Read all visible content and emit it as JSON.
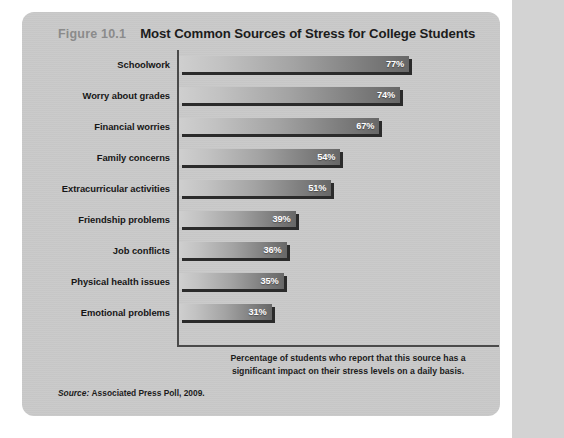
{
  "figure": {
    "number": "Figure 10.1",
    "title": "Most Common Sources of Stress for College Students",
    "caption_line1": "Percentage of students who report that this source has a",
    "caption_line2": "significant impact on their stress levels on a daily basis.",
    "source_label": "Source:",
    "source_text": "Associated Press Poll, 2009."
  },
  "chart_data": {
    "type": "bar",
    "orientation": "horizontal",
    "title": "Most Common Sources of Stress for College Students",
    "xlabel": "Percentage of students who report that this source has a significant impact on their stress levels on a daily basis.",
    "ylabel": "",
    "xlim": [
      0,
      100
    ],
    "grid": false,
    "legend": null,
    "value_suffix": "%",
    "categories": [
      "Schoolwork",
      "Worry about grades",
      "Financial worries",
      "Family concerns",
      "Extracurricular activities",
      "Friendship problems",
      "Job conflicts",
      "Physical health issues",
      "Emotional problems"
    ],
    "values": [
      77,
      74,
      67,
      54,
      51,
      39,
      36,
      35,
      31
    ],
    "value_labels": [
      "77%",
      "74%",
      "67%",
      "54%",
      "51%",
      "39%",
      "36%",
      "35%",
      "31%"
    ],
    "bars": [
      {
        "category": "Schoolwork",
        "value": 77,
        "label": "77%"
      },
      {
        "category": "Worry about grades",
        "value": 74,
        "label": "74%"
      },
      {
        "category": "Financial worries",
        "value": 67,
        "label": "67%"
      },
      {
        "category": "Family concerns",
        "value": 54,
        "label": "54%"
      },
      {
        "category": "Extracurricular activities",
        "value": 51,
        "label": "51%"
      },
      {
        "category": "Friendship problems",
        "value": 39,
        "label": "39%"
      },
      {
        "category": "Job conflicts",
        "value": 36,
        "label": "36%"
      },
      {
        "category": "Physical health issues",
        "value": 35,
        "label": "35%"
      },
      {
        "category": "Emotional problems",
        "value": 31,
        "label": "31%"
      }
    ]
  },
  "colors": {
    "panel_background": "#c9c9c9",
    "page_background": "#ffffff",
    "outer_strip": "#d3d3d3",
    "axis": "#4a4a4a",
    "bar_light_end": "#cfcfcf",
    "bar_dark_end": "#676767",
    "bar_shadow": "#2b2b2b",
    "value_text": "#ffffff",
    "label_text": "#161616",
    "figure_number": "#8b8b8b",
    "title_text": "#1c1c1c"
  }
}
